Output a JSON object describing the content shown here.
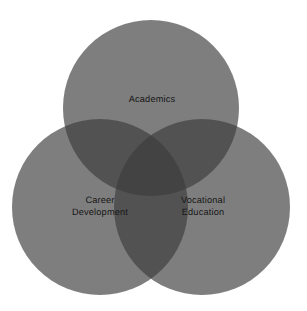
{
  "figure": {
    "type": "venn-diagram-3-set",
    "background_color": "#ffffff",
    "width": 307,
    "height": 311
  },
  "chart_data": {
    "type": "venn",
    "title": "",
    "subtitle": "",
    "xlabel": "",
    "ylabel": "",
    "sets": [
      {
        "id": "academics",
        "label": "Academics",
        "position": "top",
        "center_x": 151,
        "center_y": 108,
        "radius": 88,
        "fill_color": "#7e7e7e"
      },
      {
        "id": "career-development",
        "label": "Career\nDevelopment",
        "position": "bottom-left",
        "center_x": 100,
        "center_y": 207,
        "radius": 88,
        "fill_color": "#7e7e7e"
      },
      {
        "id": "vocational-education",
        "label": "Vocational\nEducation",
        "position": "bottom-right",
        "center_x": 202,
        "center_y": 207,
        "radius": 88,
        "fill_color": "#7e7e7e"
      }
    ],
    "overlaps": {
      "pairwise_color": "#525252",
      "triple_color": "#434343",
      "labels": []
    },
    "legend": "none",
    "grid": false
  },
  "labels": {
    "top": {
      "text": "Academics",
      "x": 152,
      "y": 100
    },
    "left": {
      "line1": "Career",
      "line2": "Development",
      "x": 100,
      "y": 207
    },
    "right": {
      "line1": "Vocational",
      "line2": "Education",
      "x": 203,
      "y": 207
    }
  },
  "colors": {
    "circle_fill": "#7e7e7e",
    "pairwise_overlap": "#525252",
    "triple_overlap": "#434343",
    "text": "#151515",
    "background": "#ffffff"
  }
}
